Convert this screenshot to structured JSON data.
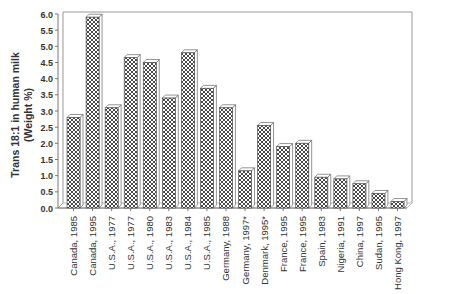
{
  "chart_data": {
    "type": "bar",
    "title": "",
    "xlabel": "",
    "ylabel": "Trans 18:1 in human milk (Weight %)",
    "ylabel_lines": [
      "Trans 18:1 in human milk",
      "(Weight %)"
    ],
    "ylim": [
      0,
      6.0
    ],
    "yticks": [
      "0.0",
      "0.5",
      "1.0",
      "1.5",
      "2.0",
      "2.5",
      "3.0",
      "3.5",
      "4.0",
      "4.5",
      "5.0",
      "5.5",
      "6.0"
    ],
    "grid": false,
    "legend": null,
    "style": "3D bars with cross-hatch pattern",
    "categories": [
      "Canada, 1985",
      "Canada, 1995",
      "U.S.A., 1977",
      "U.S.A., 1977",
      "U.S.A., 1980",
      "U.S.A., 1983",
      "U.S.A., 1984",
      "U.S.A., 1985",
      "Germany, 1988",
      "Germany, 1997*",
      "Denmark, 1995*",
      "France, 1995",
      "France, 1995",
      "Spain, 1983",
      "Nigeria, 1991",
      "China, 1997",
      "Sudan, 1995",
      "Hong Kong, 1997"
    ],
    "values": [
      2.8,
      5.9,
      3.1,
      4.65,
      4.5,
      3.4,
      4.8,
      3.7,
      3.1,
      1.15,
      2.55,
      1.9,
      2.0,
      0.95,
      0.9,
      0.75,
      0.45,
      0.2
    ]
  },
  "colors": {
    "bar_pattern": "#333333",
    "bar_fill": "#ffffff",
    "frame": "#999999",
    "text": "#333333"
  }
}
